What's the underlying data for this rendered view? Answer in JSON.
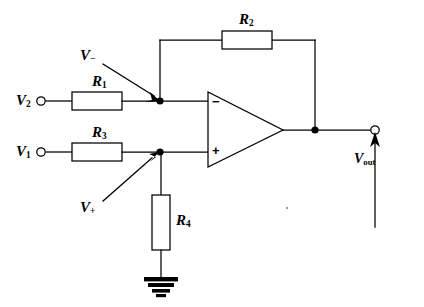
{
  "diagram": {
    "type": "circuit-schematic",
    "background_color": "#ffffff",
    "line_color": "#000000"
  },
  "components": {
    "resistors": [
      {
        "id": "R2",
        "label": "R",
        "subscript": "2",
        "orientation": "horizontal",
        "role": "feedback-resistor"
      },
      {
        "id": "R1",
        "label": "R",
        "subscript": "1",
        "orientation": "horizontal",
        "role": "inverting-input-resistor"
      },
      {
        "id": "R3",
        "label": "R",
        "subscript": "3",
        "orientation": "horizontal",
        "role": "noninverting-input-resistor"
      },
      {
        "id": "R4",
        "label": "R",
        "subscript": "4",
        "orientation": "vertical",
        "role": "noninverting-ground-resistor"
      }
    ],
    "opamp": {
      "name": "operational-amplifier",
      "inverting_input_symbol": "−",
      "noninverting_input_symbol": "+"
    },
    "ground": {
      "name": "ground-symbol",
      "style": "stacked-solid-bars"
    }
  },
  "terminals": {
    "v2": {
      "label": "V",
      "subscript": "2",
      "role": "input-terminal"
    },
    "v1": {
      "label": "V",
      "subscript": "1",
      "role": "input-terminal"
    },
    "vout": {
      "label": "V",
      "subscript": "out",
      "role": "output-terminal"
    }
  },
  "nodes": {
    "v_minus": {
      "label": "V",
      "subscript": "−",
      "role": "inverting-node-annotation"
    },
    "v_plus": {
      "label": "V",
      "subscript": "+",
      "role": "noninverting-node-annotation"
    }
  },
  "labels": {
    "r2": "R",
    "r2_sub": "2",
    "r1": "R",
    "r1_sub": "1",
    "r3": "R",
    "r3_sub": "3",
    "r4": "R",
    "r4_sub": "4",
    "v2": "V",
    "v2_sub": "2",
    "v1": "V",
    "v1_sub": "1",
    "vout": "V",
    "vout_sub": "out",
    "vminus": "V",
    "vminus_sub": "−",
    "vplus": "V",
    "vplus_sub": "+",
    "minus_sign": "−",
    "plus_sign": "+"
  }
}
